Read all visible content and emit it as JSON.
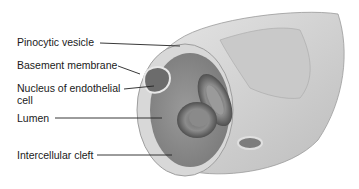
{
  "diagram": {
    "labels": [
      {
        "id": "pinocytic-vesicle",
        "text": "Pinocytic vesicle"
      },
      {
        "id": "basement-membrane",
        "text": "Basement membrane"
      },
      {
        "id": "nucleus-line1",
        "text": "Nucleus of endothelial"
      },
      {
        "id": "nucleus-line2",
        "text": "cell"
      },
      {
        "id": "lumen",
        "text": "Lumen"
      },
      {
        "id": "intercellular-cleft",
        "text": "Intercellular cleft"
      }
    ]
  }
}
